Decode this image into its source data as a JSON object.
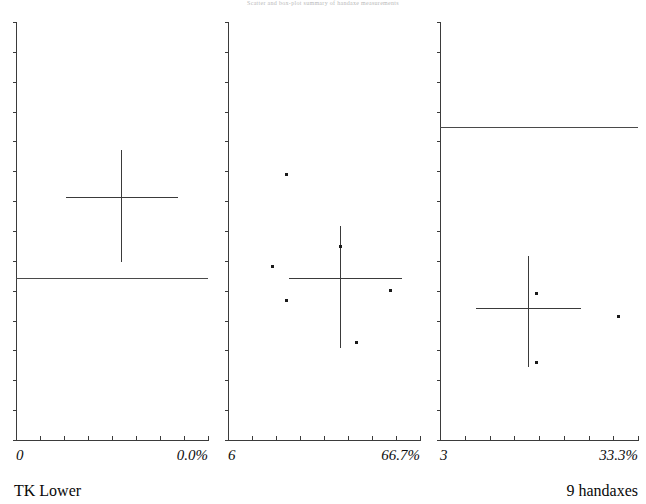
{
  "figure": {
    "title": "Scatter and box-plot summary of handaxe measurements",
    "width": 646,
    "height": 504,
    "background": "#ffffff",
    "ink_color": "#3b3b3b"
  },
  "captions": {
    "bottom_left": "TK Lower",
    "bottom_right": "9 handaxes"
  },
  "chart_data": {
    "type": "scatter",
    "title": "Scatter and box-plot summary of handaxe measurements",
    "xlabel": "",
    "ylabel": "",
    "grid": false,
    "legend": false,
    "layout": "three side-by-side panels sharing a common vertical scale",
    "panels": [
      {
        "name": "panel-1",
        "index": 1,
        "x_tick_labels": [
          "0",
          "0.0%"
        ],
        "x_left_label": "0",
        "x_right_label": "0.0%",
        "x_axis_ticks": 9,
        "y_axis_ticks": 14,
        "cross": {
          "center_x_frac": 0.547,
          "center_y_frac": 0.419,
          "v_top_frac": 0.306,
          "v_bottom_frac": 0.574,
          "h_left_frac": 0.26,
          "h_right_frac": 0.844
        },
        "reference_line": {
          "y_frac": 0.613,
          "x_start_frac": 0.0,
          "x_end_frac": 1.0
        },
        "points": []
      },
      {
        "name": "panel-2",
        "index": 2,
        "x_tick_labels": [
          "6",
          "66.7%"
        ],
        "x_left_label": "6",
        "x_right_label": "66.7%",
        "x_axis_ticks": 9,
        "y_axis_ticks": 14,
        "cross": {
          "center_x_frac": 0.583,
          "center_y_frac": 0.613,
          "v_top_frac": 0.489,
          "v_bottom_frac": 0.779,
          "h_left_frac": 0.318,
          "h_right_frac": 0.906
        },
        "reference_line": null,
        "points": [
          {
            "x_frac": 0.302,
            "y_frac": 0.364
          },
          {
            "x_frac": 0.229,
            "y_frac": 0.584
          },
          {
            "x_frac": 0.302,
            "y_frac": 0.666
          },
          {
            "x_frac": 0.583,
            "y_frac": 0.536
          },
          {
            "x_frac": 0.844,
            "y_frac": 0.641
          },
          {
            "x_frac": 0.667,
            "y_frac": 0.766
          }
        ]
      },
      {
        "name": "panel-3",
        "index": 3,
        "x_tick_labels": [
          "3",
          "33.3%"
        ],
        "x_left_label": "3",
        "x_right_label": "33.3%",
        "x_axis_ticks": 9,
        "y_axis_ticks": 14,
        "cross": {
          "center_x_frac": 0.444,
          "center_y_frac": 0.685,
          "v_top_frac": 0.561,
          "v_bottom_frac": 0.825,
          "h_left_frac": 0.182,
          "h_right_frac": 0.712
        },
        "reference_line": {
          "y_frac": 0.252,
          "x_start_frac": 0.0,
          "x_end_frac": 1.0
        },
        "points": [
          {
            "x_frac": 0.485,
            "y_frac": 0.649
          },
          {
            "x_frac": 0.899,
            "y_frac": 0.703
          },
          {
            "x_frac": 0.485,
            "y_frac": 0.813
          }
        ]
      }
    ]
  }
}
